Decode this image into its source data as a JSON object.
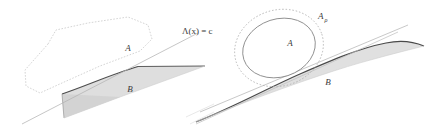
{
  "figure": {
    "name": "convex-separation-diagram",
    "background_color": "#ffffff",
    "panels": [
      {
        "id": "left-panel",
        "description": "Polygonal set A separated from shaded region B by a straight line",
        "labels": {
          "set_a": "A",
          "set_b": "B",
          "separating_line": "Λ(x) = c"
        }
      },
      {
        "id": "right-panel",
        "description": "Smooth oval set A with dotted rho-neighborhood A rho, tangent lines, and curved shaded region B",
        "labels": {
          "set_a": "A",
          "set_b": "B",
          "neighborhood_base": "A",
          "neighborhood_subscript": "ρ"
        }
      }
    ],
    "colors": {
      "outline_light": "#c9c9c9",
      "outline_dotted": "#b0b0b0",
      "outline_dark": "#555555",
      "curve_dark": "#4a4a4a",
      "shade_fill": "#d9d9d9",
      "shade_fill_light": "#e3e3e3",
      "line_thin": "#b5b5b5",
      "text": "#3a3a3a"
    }
  }
}
